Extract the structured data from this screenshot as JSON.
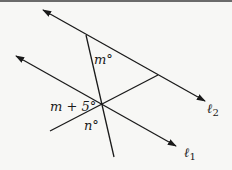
{
  "figure": {
    "lines": {
      "l1": {
        "label_main": "ℓ",
        "label_sub": "1"
      },
      "l2": {
        "label_main": "ℓ",
        "label_sub": "2"
      }
    },
    "angles": {
      "top": "m°",
      "left": "m + 5°",
      "bottom": "n°"
    },
    "colors": {
      "stroke": "#1a1a1a",
      "background": "#f7f7f5"
    }
  }
}
